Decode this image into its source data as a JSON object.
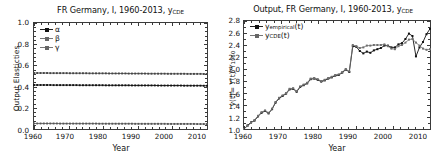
{
  "left_panel": {
    "title_main": "FR Germany, I, 1960-2013, y",
    "title_sub": "CDE",
    "ylabel": "Output Elasticties",
    "xlabel": "Year",
    "yticks": [
      "0.0",
      "0.2",
      "0.4",
      "0.6",
      "0.8",
      "1.0"
    ],
    "xticks": [
      "1960",
      "1970",
      "1980",
      "1990",
      "2000",
      "2010"
    ],
    "legend": [
      {
        "label": "α",
        "color": "#111111"
      },
      {
        "label": "β",
        "color": "#555555"
      },
      {
        "label": "γ",
        "color": "#777777"
      }
    ]
  },
  "right_panel": {
    "title_main": "Output, FR Germany, I, 1960-2013, y",
    "title_sub": "CDE",
    "ylabel_pre": "y(t)= Y(t)/Y",
    "ylabel_sub": "1960",
    "xlabel": "Year",
    "yticks": [
      "1.0",
      "1.2",
      "1.4",
      "1.6",
      "1.8",
      "2.0",
      "2.2",
      "2.4",
      "2.6",
      "2.8"
    ],
    "xticks": [
      "1960",
      "1970",
      "1980",
      "1990",
      "2000",
      "2010"
    ],
    "legend": [
      {
        "pre": "y",
        "sub": "empirical",
        "post": "(t)",
        "color": "#111111"
      },
      {
        "pre": "y",
        "sub": "CDE",
        "post": "(t)",
        "color": "#777777"
      }
    ]
  },
  "chart_data": [
    {
      "type": "line",
      "title": "FR Germany, I, 1960-2013, yCDE",
      "xlabel": "Year",
      "ylabel": "Output Elasticties",
      "xlim": [
        1960,
        2013
      ],
      "ylim": [
        0.0,
        1.0
      ],
      "grid": false,
      "legend_position": "upper-left",
      "x": [
        1960,
        1961,
        1962,
        1963,
        1964,
        1965,
        1966,
        1967,
        1968,
        1969,
        1970,
        1971,
        1972,
        1973,
        1974,
        1975,
        1976,
        1977,
        1978,
        1979,
        1980,
        1981,
        1982,
        1983,
        1984,
        1985,
        1986,
        1987,
        1988,
        1989,
        1990,
        1991,
        1992,
        1993,
        1994,
        1995,
        1996,
        1997,
        1998,
        1999,
        2000,
        2001,
        2002,
        2003,
        2004,
        2005,
        2006,
        2007,
        2008,
        2009,
        2010,
        2011,
        2012,
        2013
      ],
      "series": [
        {
          "name": "α",
          "values": [
            0.415,
            0.415,
            0.415,
            0.415,
            0.415,
            0.415,
            0.414,
            0.414,
            0.414,
            0.414,
            0.414,
            0.414,
            0.414,
            0.414,
            0.413,
            0.413,
            0.413,
            0.413,
            0.413,
            0.413,
            0.413,
            0.413,
            0.412,
            0.412,
            0.412,
            0.412,
            0.412,
            0.412,
            0.412,
            0.412,
            0.411,
            0.411,
            0.411,
            0.411,
            0.411,
            0.411,
            0.411,
            0.411,
            0.41,
            0.41,
            0.41,
            0.41,
            0.41,
            0.41,
            0.41,
            0.41,
            0.409,
            0.409,
            0.409,
            0.409,
            0.409,
            0.409,
            0.408,
            0.408
          ]
        },
        {
          "name": "β",
          "values": [
            0.528,
            0.528,
            0.528,
            0.528,
            0.528,
            0.527,
            0.527,
            0.527,
            0.527,
            0.527,
            0.527,
            0.526,
            0.526,
            0.526,
            0.526,
            0.526,
            0.526,
            0.525,
            0.525,
            0.525,
            0.525,
            0.525,
            0.525,
            0.524,
            0.524,
            0.524,
            0.524,
            0.524,
            0.524,
            0.523,
            0.523,
            0.523,
            0.523,
            0.523,
            0.523,
            0.522,
            0.522,
            0.522,
            0.522,
            0.522,
            0.522,
            0.521,
            0.521,
            0.521,
            0.521,
            0.521,
            0.521,
            0.52,
            0.52,
            0.52,
            0.52,
            0.52,
            0.519,
            0.519
          ]
        },
        {
          "name": "γ",
          "values": [
            0.052,
            0.052,
            0.052,
            0.052,
            0.052,
            0.052,
            0.052,
            0.052,
            0.051,
            0.051,
            0.051,
            0.051,
            0.051,
            0.051,
            0.051,
            0.051,
            0.051,
            0.051,
            0.051,
            0.051,
            0.05,
            0.05,
            0.05,
            0.05,
            0.05,
            0.05,
            0.05,
            0.05,
            0.05,
            0.05,
            0.05,
            0.049,
            0.049,
            0.049,
            0.049,
            0.049,
            0.049,
            0.049,
            0.049,
            0.049,
            0.049,
            0.048,
            0.048,
            0.048,
            0.048,
            0.048,
            0.048,
            0.048,
            0.048,
            0.048,
            0.047,
            0.047,
            0.047,
            0.047
          ]
        }
      ]
    },
    {
      "type": "line",
      "title": "Output, FR Germany, I, 1960-2013, yCDE",
      "xlabel": "Year",
      "ylabel": "y(t)= Y(t)/Y1960",
      "xlim": [
        1960,
        2013
      ],
      "ylim": [
        1.0,
        2.8
      ],
      "grid": false,
      "legend_position": "upper-left",
      "x": [
        1960,
        1961,
        1962,
        1963,
        1964,
        1965,
        1966,
        1967,
        1968,
        1969,
        1970,
        1971,
        1972,
        1973,
        1974,
        1975,
        1976,
        1977,
        1978,
        1979,
        1980,
        1981,
        1982,
        1983,
        1984,
        1985,
        1986,
        1987,
        1988,
        1989,
        1990,
        1991,
        1992,
        1993,
        1994,
        1995,
        1996,
        1997,
        1998,
        1999,
        2000,
        2001,
        2002,
        2003,
        2004,
        2005,
        2006,
        2007,
        2008,
        2009,
        2010,
        2011,
        2012,
        2013
      ],
      "series": [
        {
          "name": "yempirical(t)",
          "values": [
            1.0,
            1.06,
            1.11,
            1.14,
            1.21,
            1.27,
            1.3,
            1.26,
            1.33,
            1.44,
            1.51,
            1.55,
            1.59,
            1.66,
            1.67,
            1.62,
            1.7,
            1.73,
            1.76,
            1.83,
            1.84,
            1.82,
            1.79,
            1.81,
            1.84,
            1.86,
            1.89,
            1.9,
            1.94,
            1.99,
            1.95,
            2.38,
            2.37,
            2.3,
            2.26,
            2.29,
            2.27,
            2.31,
            2.33,
            2.35,
            2.39,
            2.39,
            2.36,
            2.36,
            2.41,
            2.43,
            2.5,
            2.59,
            2.55,
            2.21,
            2.36,
            2.45,
            2.58,
            2.67
          ]
        },
        {
          "name": "yCDE(t)",
          "values": [
            1.0,
            1.05,
            1.1,
            1.15,
            1.22,
            1.28,
            1.31,
            1.27,
            1.34,
            1.45,
            1.52,
            1.56,
            1.6,
            1.67,
            1.68,
            1.63,
            1.71,
            1.74,
            1.77,
            1.84,
            1.85,
            1.83,
            1.8,
            1.82,
            1.85,
            1.87,
            1.9,
            1.91,
            1.95,
            2.0,
            1.96,
            2.4,
            2.38,
            2.35,
            2.36,
            2.39,
            2.39,
            2.4,
            2.4,
            2.4,
            2.41,
            2.38,
            2.34,
            2.33,
            2.38,
            2.4,
            2.44,
            2.49,
            2.5,
            2.44,
            2.39,
            2.34,
            2.32,
            2.33
          ]
        }
      ]
    }
  ]
}
